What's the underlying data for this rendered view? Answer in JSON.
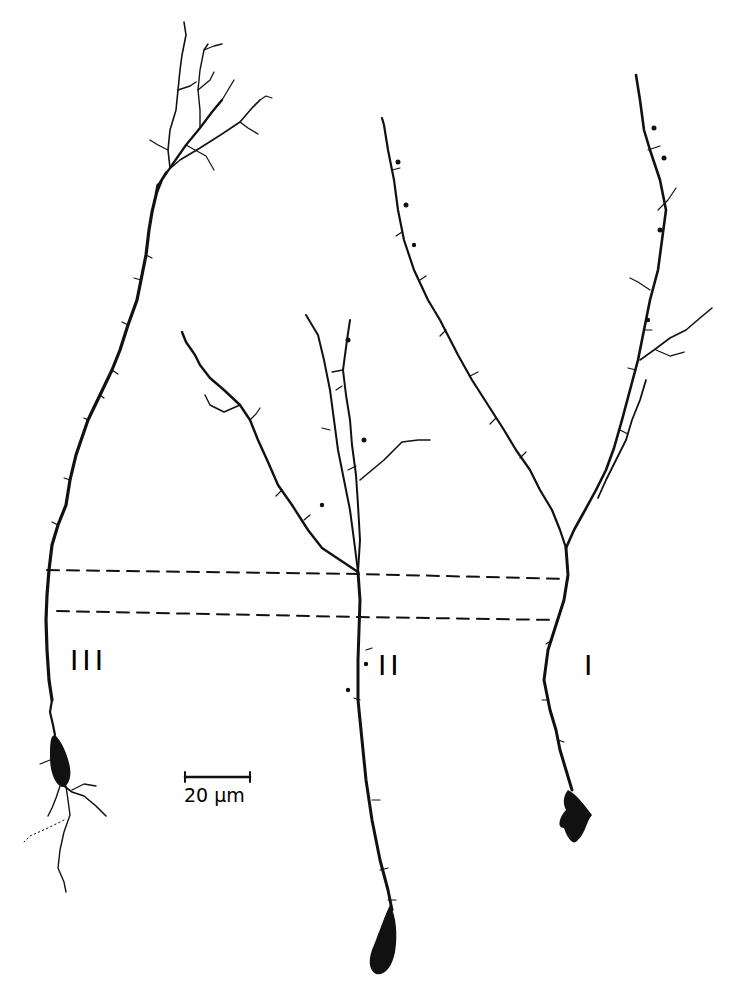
{
  "figure": {
    "background": "#ffffff",
    "ink_color": "#111111",
    "neurons": [
      {
        "id": "neuron-III",
        "label": "III",
        "label_pos": [
          70,
          645
        ]
      },
      {
        "id": "neuron-II",
        "label": "II",
        "label_pos": [
          378,
          650
        ]
      },
      {
        "id": "neuron-I",
        "label": "I",
        "label_pos": [
          584,
          650
        ]
      }
    ],
    "scale_bar": {
      "label": "20 µm",
      "x1": 185,
      "x2": 250,
      "y": 777
    },
    "dashed_lines": [
      {
        "name": "upper-boundary",
        "points": [
          [
            47,
            570
          ],
          [
            360,
            574
          ],
          [
            568,
            579
          ]
        ]
      },
      {
        "name": "lower-boundary",
        "points": [
          [
            57,
            611
          ],
          [
            360,
            617
          ],
          [
            558,
            620
          ]
        ]
      }
    ]
  }
}
